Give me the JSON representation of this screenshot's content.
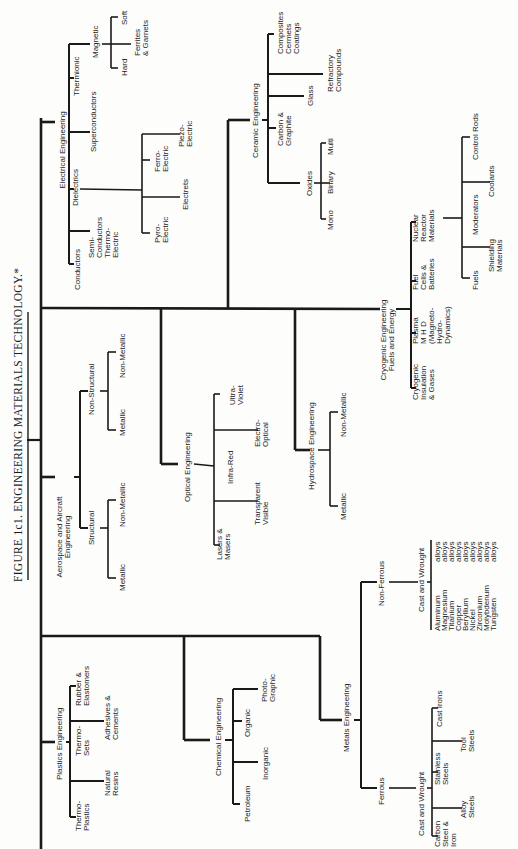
{
  "title": "FIGURE 1c1.  ENGINEERING MATERIALS TECHNOLOGY.*",
  "root": {
    "electrical": {
      "label": "Electrical Engineering",
      "conductors": "Conductors",
      "semi": [
        "Semi-",
        "Conductors",
        "Thermo-",
        "Electric"
      ],
      "dielectrics": "Dielectrics",
      "pyro": [
        "Pyro-",
        "Electric"
      ],
      "electrets": "Electrets",
      "ferro": [
        "Ferro-",
        "Electric"
      ],
      "piezo": [
        "Piezo-",
        "Electric"
      ],
      "superconductors": "Superconductors",
      "thermionic": "Thermionic",
      "magnetic": "Magnetic",
      "hard": "Hard",
      "ferrites": [
        "Ferrites",
        "& Garnets"
      ],
      "soft": "Soft"
    },
    "ceramic": {
      "label": "Ceramic Engineering",
      "oxides": "Oxides",
      "mono": "Mono",
      "binary": "Binary",
      "multi": "Multi",
      "carbon": [
        "Carbon &",
        "Graphite"
      ],
      "glass": "Glass",
      "refractory": [
        "Refractory",
        "Compounds"
      ],
      "composites": [
        "Composites",
        "Cermets",
        "Coatings"
      ]
    },
    "aerospace": {
      "label": [
        "Aerospace and Aircraft",
        "Engineering"
      ],
      "structural": "Structural",
      "nonstructural": "Non-Structural",
      "metallic": "Metallic",
      "nonmetallic": "Non-Metallic"
    },
    "optical": {
      "label": "Optical Engineering",
      "infrared": "Infra-Red",
      "lasers": [
        "Lasers &",
        "Masers"
      ],
      "transparent": [
        "Transparent",
        "Visible"
      ],
      "electro": [
        "Electro-",
        "Optical"
      ],
      "ultra": [
        "Ultra-",
        "Violet"
      ]
    },
    "hydrospace": {
      "label": "Hydrospace Engineering",
      "metallic": "Metallic",
      "nonmetallic": "Non-Metallic"
    },
    "cryogenic": {
      "label": [
        "Cryogenic Engineering",
        "Fuels and Energy"
      ],
      "insulation": [
        "Cryogenic",
        "Insulation",
        "& Gases"
      ],
      "plasma": [
        "Plasma",
        "M H D",
        "(Magneto-",
        "Hydro-",
        "Dynamics)"
      ],
      "fuelcells": [
        "Fuel",
        "Cells &",
        "Batteries"
      ],
      "nuclear": [
        "Nuclear",
        "Reactor",
        "Materials"
      ],
      "fuels": "Fuels",
      "shielding": [
        "Shielding",
        "Materials"
      ],
      "moderators": "Moderators",
      "coolants": "Coolants",
      "controlrods": "Control Rods"
    },
    "plastics": {
      "label": "Plastics Engineering",
      "thermoplastics": [
        "Thermo-",
        "Plastics"
      ],
      "natural": [
        "Natural",
        "Resins"
      ],
      "thermosets": [
        "Thermo-",
        "Sets"
      ],
      "adhesives": [
        "Adhesives &",
        "Cements"
      ],
      "rubber": [
        "Rubber &",
        "Elastomers"
      ]
    },
    "chemical": {
      "label": "Chemical Engineering",
      "petroleum": "Petroleum",
      "inorganic": "Inorganic",
      "organic": "Organic",
      "photo": [
        "Photo-",
        "Graphic"
      ]
    },
    "metals": {
      "label": "Metals Engineering",
      "ferrous": "Ferrous",
      "ferrous_cw": "Cast and Wrought",
      "carbon": [
        "Carbon",
        "Steel &",
        "Iron"
      ],
      "alloy": [
        "Alloy",
        "Steels"
      ],
      "stainless": [
        "Stainless",
        "Steels"
      ],
      "tool": [
        "Tool",
        "Steels"
      ],
      "castirons": "Cast Irons",
      "nonferrous": "Non-Ferrous",
      "nonferrous_cw": "Cast and Wrought",
      "metals_list": [
        "Aluminum",
        "Magnesium",
        "Titanium",
        "Copper",
        "Beryllium",
        "Nickel",
        "Zirconium",
        "Molybdenum",
        "Tungsten"
      ],
      "alloys_word": "alloys"
    }
  }
}
